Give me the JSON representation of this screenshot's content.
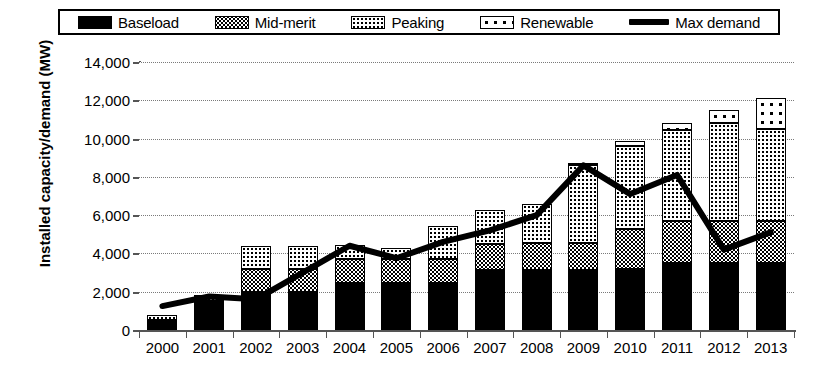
{
  "legend": {
    "items": [
      {
        "label": "Baseload",
        "icon": "pattern-swatch-baseload"
      },
      {
        "label": "Mid-merit",
        "icon": "pattern-swatch-mid-merit"
      },
      {
        "label": "Peaking",
        "icon": "pattern-swatch-peaking"
      },
      {
        "label": "Renewable",
        "icon": "pattern-swatch-renewable"
      },
      {
        "label": "Max demand",
        "icon": "line-swatch-max-demand"
      }
    ],
    "position": "top"
  },
  "axis": {
    "y_title": "Installed capacity/demand (MW)",
    "y_ticks": [
      "0",
      "2,000",
      "4,000",
      "6,000",
      "8,000",
      "10,000",
      "12,000",
      "14,000"
    ],
    "x_title": ""
  },
  "chart_data": {
    "type": "bar",
    "title": "",
    "subtitle": "",
    "xlabel": "",
    "ylabel": "Installed capacity/demand (MW)",
    "ylim": [
      0,
      14000
    ],
    "ytick_step": 2000,
    "grid": true,
    "stacked": true,
    "legend_position": "top",
    "categories": [
      "2000",
      "2001",
      "2002",
      "2003",
      "2004",
      "2005",
      "2006",
      "2007",
      "2008",
      "2009",
      "2010",
      "2011",
      "2012",
      "2013"
    ],
    "series": [
      {
        "name": "Baseload",
        "type": "bar",
        "values": [
          500,
          1500,
          2000,
          2000,
          2450,
          2450,
          2450,
          3150,
          3150,
          3150,
          3200,
          3500,
          3500,
          3500
        ]
      },
      {
        "name": "Mid-merit",
        "type": "bar",
        "values": [
          0,
          200,
          1200,
          1200,
          1250,
          1250,
          1250,
          1350,
          1400,
          1400,
          2100,
          2200,
          2200,
          2200
        ]
      },
      {
        "name": "Peaking",
        "type": "bar",
        "values": [
          300,
          100,
          1200,
          1200,
          750,
          600,
          1750,
          1750,
          2050,
          4050,
          4300,
          4750,
          5100,
          4800
        ]
      },
      {
        "name": "Renewable",
        "type": "bar",
        "values": [
          0,
          0,
          0,
          0,
          0,
          0,
          0,
          0,
          0,
          100,
          300,
          350,
          700,
          1600
        ]
      },
      {
        "name": "Max demand",
        "type": "line",
        "values": [
          1250,
          1750,
          1600,
          3000,
          4400,
          3750,
          4600,
          5200,
          6000,
          8600,
          7100,
          8100,
          4200,
          5100
        ]
      }
    ],
    "stack_totals": [
      800,
      1800,
      4400,
      4400,
      4450,
      4300,
      5450,
      6250,
      6600,
      8700,
      9900,
      10800,
      11500,
      12100
    ]
  },
  "colors": {
    "axis": "#555555",
    "grid": "#7a7a7a",
    "line": "#000000",
    "background": "#ffffff"
  }
}
